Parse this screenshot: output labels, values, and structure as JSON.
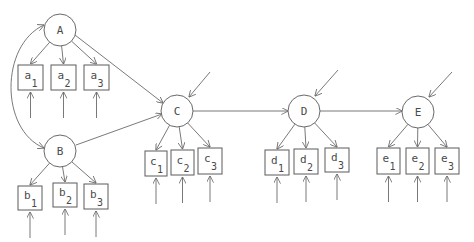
{
  "diagram": {
    "type": "path-diagram",
    "latent": [
      {
        "id": "A",
        "label": "A",
        "cx": 60,
        "cy": 30,
        "r": 16
      },
      {
        "id": "B",
        "label": "B",
        "cx": 60,
        "cy": 151,
        "r": 16
      },
      {
        "id": "C",
        "label": "C",
        "cx": 177,
        "cy": 111,
        "r": 16
      },
      {
        "id": "D",
        "label": "D",
        "cx": 304,
        "cy": 111,
        "r": 16
      },
      {
        "id": "E",
        "label": "E",
        "cx": 418,
        "cy": 112,
        "r": 16
      }
    ],
    "indicators": [
      {
        "id": "a1",
        "letter": "a",
        "sub": "1",
        "x": 18,
        "y": 65,
        "w": 25,
        "h": 25,
        "factor": "A"
      },
      {
        "id": "a2",
        "letter": "a",
        "sub": "2",
        "x": 51,
        "y": 65,
        "w": 25,
        "h": 25,
        "factor": "A"
      },
      {
        "id": "a3",
        "letter": "a",
        "sub": "3",
        "x": 84,
        "y": 65,
        "w": 25,
        "h": 25,
        "factor": "A"
      },
      {
        "id": "b1",
        "letter": "b",
        "sub": "1",
        "x": 18,
        "y": 186,
        "w": 24,
        "h": 24,
        "factor": "B"
      },
      {
        "id": "b2",
        "letter": "b",
        "sub": "2",
        "x": 53,
        "y": 183,
        "w": 24,
        "h": 24,
        "factor": "B"
      },
      {
        "id": "b3",
        "letter": "b",
        "sub": "3",
        "x": 84,
        "y": 184,
        "w": 24,
        "h": 25,
        "factor": "B"
      },
      {
        "id": "c1",
        "letter": "c",
        "sub": "1",
        "x": 145,
        "y": 151,
        "w": 22,
        "h": 25,
        "factor": "C"
      },
      {
        "id": "c2",
        "letter": "c",
        "sub": "2",
        "x": 171,
        "y": 150,
        "w": 23,
        "h": 25,
        "factor": "C"
      },
      {
        "id": "c3",
        "letter": "c",
        "sub": "3",
        "x": 198,
        "y": 148,
        "w": 24,
        "h": 26,
        "factor": "C"
      },
      {
        "id": "d1",
        "letter": "d",
        "sub": "1",
        "x": 265,
        "y": 150,
        "w": 24,
        "h": 25,
        "factor": "D"
      },
      {
        "id": "d2",
        "letter": "d",
        "sub": "2",
        "x": 294,
        "y": 149,
        "w": 24,
        "h": 25,
        "factor": "D"
      },
      {
        "id": "d3",
        "letter": "d",
        "sub": "3",
        "x": 325,
        "y": 148,
        "w": 24,
        "h": 24,
        "factor": "D"
      },
      {
        "id": "e1",
        "letter": "e",
        "sub": "1",
        "x": 377,
        "y": 148,
        "w": 23,
        "h": 26,
        "factor": "E"
      },
      {
        "id": "e2",
        "letter": "e",
        "sub": "2",
        "x": 406,
        "y": 148,
        "w": 23,
        "h": 26,
        "factor": "E"
      },
      {
        "id": "e3",
        "letter": "e",
        "sub": "3",
        "x": 435,
        "y": 148,
        "w": 24,
        "h": 26,
        "factor": "E"
      }
    ],
    "structural_paths": [
      {
        "from": "A",
        "to": "C",
        "x1": 75,
        "y1": 35,
        "x2": 163,
        "y2": 103
      },
      {
        "from": "B",
        "to": "C",
        "x1": 76,
        "y1": 145,
        "x2": 162,
        "y2": 114
      },
      {
        "from": "C",
        "to": "D",
        "x1": 193,
        "y1": 111,
        "x2": 288,
        "y2": 111
      },
      {
        "from": "D",
        "to": "E",
        "x1": 320,
        "y1": 111,
        "x2": 402,
        "y2": 111
      }
    ],
    "covariance": {
      "between": [
        "A",
        "B"
      ],
      "path": "M 44 25 C 0 45, 0 130, 44 148"
    },
    "disturbances": [
      {
        "target": "C",
        "x1": 210,
        "y1": 72,
        "x2": 189,
        "y2": 97
      },
      {
        "target": "D",
        "x1": 338,
        "y1": 70,
        "x2": 315,
        "y2": 96
      },
      {
        "target": "E",
        "x1": 452,
        "y1": 72,
        "x2": 429,
        "y2": 97
      }
    ],
    "measurement_error_arrow_length": 26,
    "colors": {
      "stroke": "#6a6a6a",
      "text": "#4a4a4a",
      "background": "#ffffff"
    }
  }
}
